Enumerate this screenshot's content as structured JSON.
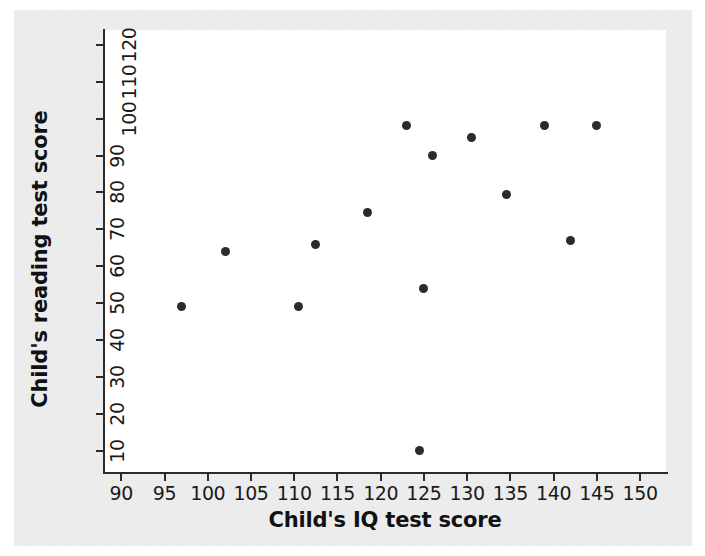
{
  "chart_data": {
    "type": "scatter",
    "title": "",
    "xlabel": "Child's IQ test score",
    "ylabel": "Child's reading test score",
    "xlim": [
      88,
      153
    ],
    "ylim": [
      4,
      124
    ],
    "xticks": [
      90,
      95,
      100,
      105,
      110,
      115,
      120,
      125,
      130,
      135,
      140,
      145,
      150
    ],
    "yticks": [
      10,
      20,
      30,
      40,
      50,
      60,
      70,
      80,
      90,
      100,
      110,
      120
    ],
    "grid": false,
    "legend": null,
    "marker_color": "#2a2a30",
    "axis_color": "#2b2b2b",
    "background_color": "#ececed",
    "plot_background_color": "#ffffff",
    "points": [
      {
        "x": 97,
        "y": 49
      },
      {
        "x": 102,
        "y": 64
      },
      {
        "x": 110.5,
        "y": 49
      },
      {
        "x": 112.5,
        "y": 66
      },
      {
        "x": 118.5,
        "y": 74.5
      },
      {
        "x": 123,
        "y": 98
      },
      {
        "x": 124.5,
        "y": 10
      },
      {
        "x": 125,
        "y": 54
      },
      {
        "x": 126,
        "y": 90
      },
      {
        "x": 130.5,
        "y": 95
      },
      {
        "x": 134.5,
        "y": 79.5
      },
      {
        "x": 139,
        "y": 98
      },
      {
        "x": 142,
        "y": 67
      },
      {
        "x": 145,
        "y": 98
      }
    ]
  }
}
